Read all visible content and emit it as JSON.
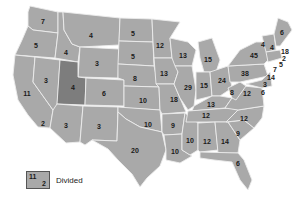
{
  "map": {
    "title": "",
    "fill_color": "#a9a9a9",
    "divided_color": "#7d7d7d",
    "border_color": "#ececec",
    "states": [
      {
        "name": "WA",
        "value": "7",
        "x": 43,
        "y": 21
      },
      {
        "name": "OR",
        "value": "5",
        "x": 36,
        "y": 45
      },
      {
        "name": "CA",
        "value": "11",
        "x": 27,
        "y": 93
      },
      {
        "name": "CA-south",
        "value": "2",
        "x": 43,
        "y": 123
      },
      {
        "name": "NV",
        "value": "3",
        "x": 46,
        "y": 80
      },
      {
        "name": "ID",
        "value": "4",
        "x": 66,
        "y": 52
      },
      {
        "name": "MT",
        "value": "4",
        "x": 91,
        "y": 35
      },
      {
        "name": "WY",
        "value": "3",
        "x": 97,
        "y": 63
      },
      {
        "name": "UT",
        "value": "4",
        "x": 73,
        "y": 87,
        "divided": true
      },
      {
        "name": "AZ",
        "value": "3",
        "x": 66,
        "y": 125
      },
      {
        "name": "CO",
        "value": "6",
        "x": 104,
        "y": 93
      },
      {
        "name": "NM",
        "value": "3",
        "x": 99,
        "y": 126
      },
      {
        "name": "ND",
        "value": "5",
        "x": 133,
        "y": 33
      },
      {
        "name": "SD",
        "value": "5",
        "x": 133,
        "y": 56
      },
      {
        "name": "NE",
        "value": "8",
        "x": 135,
        "y": 78
      },
      {
        "name": "KS",
        "value": "10",
        "x": 143,
        "y": 100
      },
      {
        "name": "OK",
        "value": "10",
        "x": 148,
        "y": 124
      },
      {
        "name": "TX",
        "value": "20",
        "x": 135,
        "y": 150
      },
      {
        "name": "MN",
        "value": "12",
        "x": 160,
        "y": 45
      },
      {
        "name": "IA",
        "value": "13",
        "x": 164,
        "y": 73
      },
      {
        "name": "MO",
        "value": "18",
        "x": 174,
        "y": 99
      },
      {
        "name": "AR",
        "value": "9",
        "x": 173,
        "y": 125
      },
      {
        "name": "LA",
        "value": "10",
        "x": 175,
        "y": 151
      },
      {
        "name": "WI",
        "value": "13",
        "x": 183,
        "y": 55
      },
      {
        "name": "IL",
        "value": "29",
        "x": 188,
        "y": 87
      },
      {
        "name": "MS",
        "value": "10",
        "x": 190,
        "y": 140
      },
      {
        "name": "MI",
        "value": "15",
        "x": 208,
        "y": 59
      },
      {
        "name": "IN",
        "value": "15",
        "x": 204,
        "y": 85
      },
      {
        "name": "KY",
        "value": "13",
        "x": 211,
        "y": 104
      },
      {
        "name": "TN",
        "value": "12",
        "x": 206,
        "y": 115
      },
      {
        "name": "AL",
        "value": "12",
        "x": 207,
        "y": 141
      },
      {
        "name": "OH",
        "value": "24",
        "x": 222,
        "y": 80
      },
      {
        "name": "GA",
        "value": "14",
        "x": 225,
        "y": 141
      },
      {
        "name": "FL",
        "value": "6",
        "x": 238,
        "y": 163
      },
      {
        "name": "WV",
        "value": "8",
        "x": 232,
        "y": 92
      },
      {
        "name": "VA",
        "value": "12",
        "x": 247,
        "y": 93
      },
      {
        "name": "NC",
        "value": "12",
        "x": 244,
        "y": 118
      },
      {
        "name": "SC",
        "value": "9",
        "x": 238,
        "y": 133
      },
      {
        "name": "PA",
        "value": "38",
        "x": 245,
        "y": 73
      },
      {
        "name": "NY",
        "value": "45",
        "x": 254,
        "y": 55
      },
      {
        "name": "VT",
        "value": "4",
        "x": 263,
        "y": 44
      },
      {
        "name": "NH",
        "value": "4",
        "x": 272,
        "y": 47
      },
      {
        "name": "ME",
        "value": "6",
        "x": 282,
        "y": 32
      },
      {
        "name": "MA",
        "value": "18",
        "x": 285,
        "y": 51
      },
      {
        "name": "RI",
        "value": "2",
        "x": 284,
        "y": 58
      },
      {
        "name": "CT",
        "value": "5",
        "x": 281,
        "y": 64
      },
      {
        "name": "NJ",
        "value": "7",
        "x": 275,
        "y": 69
      },
      {
        "name": "MD",
        "value": "14",
        "x": 271,
        "y": 77
      },
      {
        "name": "DE",
        "value": "3",
        "x": 265,
        "y": 84
      },
      {
        "name": "MD-2",
        "value": "6",
        "x": 263,
        "y": 92
      }
    ]
  },
  "legend": {
    "top_value": "11",
    "bottom_value": "2",
    "label": "Divided"
  }
}
